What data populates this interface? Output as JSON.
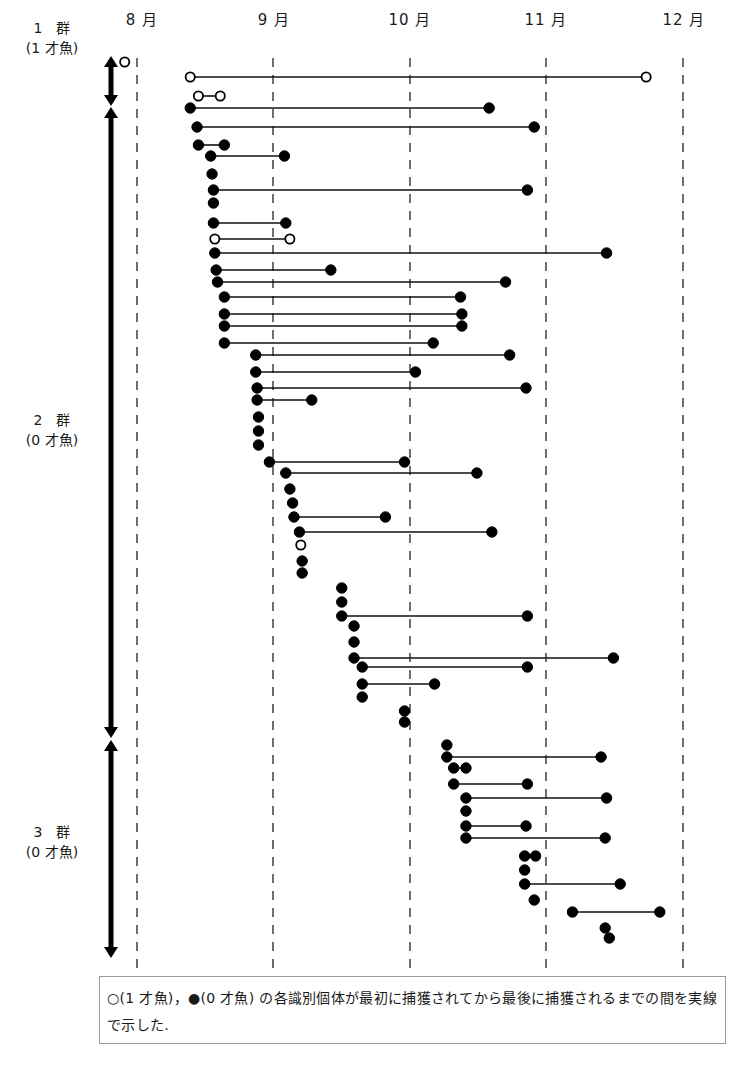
{
  "chart_data": {
    "type": "timeline-range",
    "title": "",
    "x_axis": {
      "unit": "month",
      "tick_labels": [
        "8 月",
        "9 月",
        "10 月",
        "11 月",
        "12 月"
      ],
      "ticks": [
        8,
        9,
        10,
        11,
        12
      ],
      "range": [
        8,
        12.2
      ],
      "grid": "dashed-vertical"
    },
    "groups": [
      {
        "id": 1,
        "label": "1　群",
        "sublabel": "(1 才魚)",
        "age": 1
      },
      {
        "id": 2,
        "label": "2　群",
        "sublabel": "(0 才魚)",
        "age": 0
      },
      {
        "id": 3,
        "label": "3　群",
        "sublabel": "(0 才魚)",
        "age": 0
      }
    ],
    "legend": {
      "open_circle": "○ (1 才魚)",
      "filled_circle": "● (0 才魚)"
    },
    "series": [
      {
        "group": 1,
        "age": 1,
        "start": 7.91,
        "end": null,
        "y": 62
      },
      {
        "group": 1,
        "age": 1,
        "start": 8.39,
        "end": 11.73,
        "y": 77
      },
      {
        "group": 1,
        "age": 1,
        "start": 8.45,
        "end": 8.61,
        "y": 96
      },
      {
        "group": 2,
        "age": 0,
        "start": 8.39,
        "end": 10.58,
        "y": 108
      },
      {
        "group": 2,
        "age": 0,
        "start": 8.44,
        "end": 10.91,
        "y": 127
      },
      {
        "group": 2,
        "age": 0,
        "start": 8.45,
        "end": 8.64,
        "y": 145
      },
      {
        "group": 2,
        "age": 0,
        "start": 8.54,
        "end": 9.08,
        "y": 156
      },
      {
        "group": 2,
        "age": 0,
        "start": 8.55,
        "end": null,
        "y": 174
      },
      {
        "group": 2,
        "age": 0,
        "start": 8.56,
        "end": 10.86,
        "y": 190
      },
      {
        "group": 2,
        "age": 0,
        "start": 8.56,
        "end": null,
        "y": 203
      },
      {
        "group": 2,
        "age": 0,
        "start": 8.56,
        "end": 9.09,
        "y": 223
      },
      {
        "group": 2,
        "age": 1,
        "start": 8.57,
        "end": 9.12,
        "y": 239
      },
      {
        "group": 2,
        "age": 0,
        "start": 8.57,
        "end": 11.44,
        "y": 253
      },
      {
        "group": 2,
        "age": 0,
        "start": 8.58,
        "end": 9.42,
        "y": 270
      },
      {
        "group": 2,
        "age": 0,
        "start": 8.59,
        "end": 10.7,
        "y": 282
      },
      {
        "group": 2,
        "age": 0,
        "start": 8.64,
        "end": 10.37,
        "y": 297
      },
      {
        "group": 2,
        "age": 0,
        "start": 8.64,
        "end": 10.38,
        "y": 314
      },
      {
        "group": 2,
        "age": 0,
        "start": 8.64,
        "end": 10.38,
        "y": 326
      },
      {
        "group": 2,
        "age": 0,
        "start": 8.64,
        "end": 10.17,
        "y": 343
      },
      {
        "group": 2,
        "age": 0,
        "start": 8.87,
        "end": 10.73,
        "y": 355
      },
      {
        "group": 2,
        "age": 0,
        "start": 8.87,
        "end": 10.04,
        "y": 372
      },
      {
        "group": 2,
        "age": 0,
        "start": 8.88,
        "end": 10.85,
        "y": 388
      },
      {
        "group": 2,
        "age": 0,
        "start": 8.88,
        "end": 9.28,
        "y": 400
      },
      {
        "group": 2,
        "age": 0,
        "start": 8.89,
        "end": null,
        "y": 417
      },
      {
        "group": 2,
        "age": 0,
        "start": 8.89,
        "end": null,
        "y": 431
      },
      {
        "group": 2,
        "age": 0,
        "start": 8.89,
        "end": null,
        "y": 445
      },
      {
        "group": 2,
        "age": 0,
        "start": 8.97,
        "end": 9.96,
        "y": 462
      },
      {
        "group": 2,
        "age": 0,
        "start": 9.09,
        "end": 10.49,
        "y": 473
      },
      {
        "group": 2,
        "age": 0,
        "start": 9.12,
        "end": null,
        "y": 489
      },
      {
        "group": 2,
        "age": 0,
        "start": 9.14,
        "end": null,
        "y": 503
      },
      {
        "group": 2,
        "age": 0,
        "start": 9.15,
        "end": 9.82,
        "y": 517
      },
      {
        "group": 2,
        "age": 0,
        "start": 9.19,
        "end": 10.6,
        "y": 532
      },
      {
        "group": 2,
        "age": 1,
        "start": 9.2,
        "end": null,
        "y": 545
      },
      {
        "group": 2,
        "age": 0,
        "start": 9.21,
        "end": null,
        "y": 561
      },
      {
        "group": 2,
        "age": 0,
        "start": 9.21,
        "end": null,
        "y": 573
      },
      {
        "group": 2,
        "age": 0,
        "start": 9.5,
        "end": null,
        "y": 588
      },
      {
        "group": 2,
        "age": 0,
        "start": 9.5,
        "end": null,
        "y": 602
      },
      {
        "group": 2,
        "age": 0,
        "start": 9.5,
        "end": 10.86,
        "y": 616
      },
      {
        "group": 2,
        "age": 0,
        "start": 9.59,
        "end": null,
        "y": 626
      },
      {
        "group": 2,
        "age": 0,
        "start": 9.59,
        "end": null,
        "y": 642
      },
      {
        "group": 2,
        "age": 0,
        "start": 9.59,
        "end": 11.49,
        "y": 658
      },
      {
        "group": 2,
        "age": 0,
        "start": 9.65,
        "end": 10.86,
        "y": 667
      },
      {
        "group": 2,
        "age": 0,
        "start": 9.65,
        "end": 10.18,
        "y": 684
      },
      {
        "group": 2,
        "age": 0,
        "start": 9.65,
        "end": null,
        "y": 697
      },
      {
        "group": 2,
        "age": 0,
        "start": 9.96,
        "end": null,
        "y": 711
      },
      {
        "group": 2,
        "age": 0,
        "start": 9.96,
        "end": null,
        "y": 722
      },
      {
        "group": 3,
        "age": 0,
        "start": 10.27,
        "end": null,
        "y": 745
      },
      {
        "group": 3,
        "age": 0,
        "start": 10.27,
        "end": 11.4,
        "y": 757
      },
      {
        "group": 3,
        "age": 0,
        "start": 10.32,
        "end": 10.41,
        "y": 768
      },
      {
        "group": 3,
        "age": 0,
        "start": 10.32,
        "end": 10.86,
        "y": 784
      },
      {
        "group": 3,
        "age": 0,
        "start": 10.41,
        "end": 11.44,
        "y": 798
      },
      {
        "group": 3,
        "age": 0,
        "start": 10.41,
        "end": null,
        "y": 811
      },
      {
        "group": 3,
        "age": 0,
        "start": 10.41,
        "end": 10.85,
        "y": 826
      },
      {
        "group": 3,
        "age": 0,
        "start": 10.41,
        "end": 11.43,
        "y": 838
      },
      {
        "group": 3,
        "age": 0,
        "start": 10.84,
        "end": 10.92,
        "y": 856
      },
      {
        "group": 3,
        "age": 0,
        "start": 10.84,
        "end": null,
        "y": 870
      },
      {
        "group": 3,
        "age": 0,
        "start": 10.84,
        "end": 11.54,
        "y": 884
      },
      {
        "group": 3,
        "age": 0,
        "start": 10.91,
        "end": null,
        "y": 900
      },
      {
        "group": 3,
        "age": 0,
        "start": 11.19,
        "end": 11.83,
        "y": 912
      },
      {
        "group": 3,
        "age": 0,
        "start": 11.43,
        "end": null,
        "y": 928
      },
      {
        "group": 3,
        "age": 0,
        "start": 11.46,
        "end": null,
        "y": 938
      }
    ]
  },
  "layout": {
    "month_px": {
      "8": 137,
      "9": 273,
      "10": 410,
      "11": 546,
      "12": 683
    },
    "grid_top": 30,
    "grid_bottom": 970,
    "group_arrows": [
      {
        "group": 1,
        "y1": 56,
        "y2": 106
      },
      {
        "group": 2,
        "y1": 107,
        "y2": 738
      },
      {
        "group": 3,
        "y1": 740,
        "y2": 958
      }
    ],
    "group_label_y": [
      18,
      411,
      822
    ]
  },
  "labels": {
    "months": [
      "8 月",
      "9 月",
      "10 月",
      "11 月",
      "12 月"
    ],
    "group1": {
      "title": "1　群",
      "sub": "(1 才魚)"
    },
    "group2": {
      "title": "2　群",
      "sub": "(0 才魚)"
    },
    "group3": {
      "title": "3　群",
      "sub": "(0 才魚)"
    },
    "caption": "○(1 才魚)，●(0 才魚) の各識別個体が最初に捕獲されてから最後に捕獲されるまでの間を実線で示した."
  }
}
